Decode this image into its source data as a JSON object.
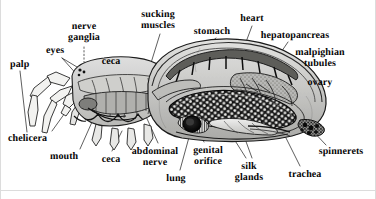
{
  "figure": {
    "kind": "anatomical-diagram",
    "background_color": "#ffffff",
    "ink_color": "#1a1a1a",
    "label_color": "#050505",
    "frame_color": "#d8d8d8"
  },
  "labels": [
    {
      "name": "palp",
      "text": "palp",
      "x": 10,
      "y": 60,
      "align": "left"
    },
    {
      "name": "eyes",
      "text": "eyes",
      "x": 46,
      "y": 46,
      "align": "left"
    },
    {
      "name": "nerve-ganglia",
      "text": "nerve\nganglia",
      "x": 84,
      "y": 22,
      "align": "center"
    },
    {
      "name": "ceca-upper",
      "text": "ceca",
      "x": 111,
      "y": 57,
      "align": "center"
    },
    {
      "name": "sucking-muscles",
      "text": "sucking\nmuscles",
      "x": 158,
      "y": 10,
      "align": "center"
    },
    {
      "name": "stomach",
      "text": "stomach",
      "x": 212,
      "y": 27,
      "align": "center"
    },
    {
      "name": "heart",
      "text": "heart",
      "x": 252,
      "y": 14,
      "align": "center"
    },
    {
      "name": "hepatopancreas",
      "text": "hepatopancreas",
      "x": 295,
      "y": 31,
      "align": "center"
    },
    {
      "name": "malpighian-tubules",
      "text": "malpighian\ntubules",
      "x": 320,
      "y": 48,
      "align": "center"
    },
    {
      "name": "ovary",
      "text": "ovary",
      "x": 320,
      "y": 78,
      "align": "center"
    },
    {
      "name": "chelicera",
      "text": "chelicera",
      "x": 8,
      "y": 134,
      "align": "left"
    },
    {
      "name": "mouth",
      "text": "mouth",
      "x": 50,
      "y": 152,
      "align": "left"
    },
    {
      "name": "ceca-lower",
      "text": "ceca",
      "x": 111,
      "y": 155,
      "align": "center"
    },
    {
      "name": "abdominal-nerve",
      "text": "abdominal\nnerve",
      "x": 155,
      "y": 147,
      "align": "center"
    },
    {
      "name": "lung",
      "text": "lung",
      "x": 176,
      "y": 174,
      "align": "center"
    },
    {
      "name": "genital-orifice",
      "text": "genital\norifice",
      "x": 208,
      "y": 146,
      "align": "center"
    },
    {
      "name": "silk-glands",
      "text": "silk\nglands",
      "x": 249,
      "y": 162,
      "align": "center"
    },
    {
      "name": "trachea",
      "text": "trachea",
      "x": 305,
      "y": 170,
      "align": "center"
    },
    {
      "name": "spinnerets",
      "text": "spinnerets",
      "x": 341,
      "y": 147,
      "align": "center"
    }
  ]
}
